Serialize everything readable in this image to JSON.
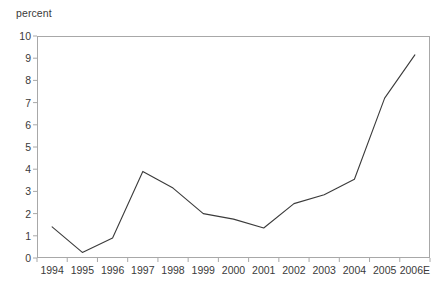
{
  "chart_data": {
    "type": "line",
    "title": "",
    "subtitle": "",
    "xlabel": "",
    "ylabel": "percent",
    "unit_label": "percent",
    "categories": [
      "1994",
      "1995",
      "1996",
      "1997",
      "1998",
      "1999",
      "2000",
      "2001",
      "2002",
      "2003",
      "2004",
      "2005",
      "2006E"
    ],
    "values": [
      1.4,
      0.25,
      0.9,
      3.9,
      3.15,
      2.0,
      1.75,
      1.35,
      2.45,
      2.85,
      3.55,
      7.2,
      9.15
    ],
    "series": [
      {
        "name": "percent",
        "values": [
          1.4,
          0.25,
          0.9,
          3.9,
          3.15,
          2.0,
          1.75,
          1.35,
          2.45,
          2.85,
          3.55,
          7.2,
          9.15
        ]
      }
    ],
    "ylim": [
      0,
      10
    ],
    "ytick_labels": [
      "0",
      "1",
      "2",
      "3",
      "4",
      "5",
      "6",
      "7",
      "8",
      "9",
      "10"
    ],
    "ytick_values": [
      0,
      1,
      2,
      3,
      4,
      5,
      6,
      7,
      8,
      9,
      10
    ],
    "grid": false,
    "legend": false,
    "legend_position": "none",
    "line_color": "#3b3b3b",
    "frame_color": "#a8a8a8",
    "background_color": "#ffffff",
    "annotations": []
  }
}
